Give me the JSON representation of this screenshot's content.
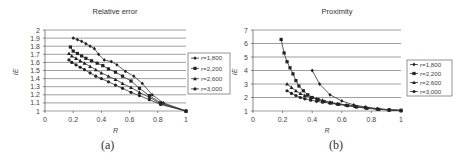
{
  "chart_data": [
    {
      "type": "line",
      "title": "Relative error",
      "xlabel": "R",
      "ylabel": "IE",
      "xlim": [
        0,
        1
      ],
      "ylim": [
        1,
        2
      ],
      "xticks": [
        "0",
        "0.2",
        "0.4",
        "0.6",
        "0.8",
        "1"
      ],
      "yticks": [
        "1",
        "1.1",
        "1.2",
        "1.3",
        "1.4",
        "1.5",
        "1.6",
        "1.7",
        "1.8",
        "1.9",
        "2"
      ],
      "grid": true,
      "legend_position": "right",
      "caption": "(a)",
      "series": [
        {
          "name": "r=1,800",
          "marker": "diamond",
          "x": [
            0.2,
            0.23,
            0.26,
            0.29,
            0.32,
            0.35,
            0.38,
            0.42,
            0.47,
            0.51,
            0.57,
            0.63,
            0.69,
            0.76,
            0.84,
            1.0
          ],
          "y": [
            1.9,
            1.88,
            1.86,
            1.83,
            1.8,
            1.77,
            1.7,
            1.63,
            1.61,
            1.57,
            1.49,
            1.43,
            1.34,
            1.2,
            1.1,
            1.0
          ]
        },
        {
          "name": "r=2,200",
          "marker": "square",
          "x": [
            0.18,
            0.2,
            0.23,
            0.26,
            0.29,
            0.33,
            0.37,
            0.41,
            0.45,
            0.5,
            0.55,
            0.61,
            0.67,
            0.74,
            0.82,
            1.0
          ],
          "y": [
            1.79,
            1.74,
            1.71,
            1.68,
            1.65,
            1.62,
            1.59,
            1.56,
            1.52,
            1.48,
            1.43,
            1.37,
            1.28,
            1.19,
            1.1,
            1.0
          ]
        },
        {
          "name": "r=2,600",
          "marker": "triangle",
          "x": [
            0.17,
            0.19,
            0.22,
            0.25,
            0.28,
            0.32,
            0.36,
            0.4,
            0.45,
            0.5,
            0.55,
            0.61,
            0.67,
            0.74,
            0.82,
            1.0
          ],
          "y": [
            1.71,
            1.68,
            1.65,
            1.62,
            1.59,
            1.55,
            1.51,
            1.47,
            1.43,
            1.39,
            1.34,
            1.29,
            1.23,
            1.17,
            1.09,
            1.0
          ]
        },
        {
          "name": "r=3,000",
          "marker": "circle",
          "x": [
            0.17,
            0.19,
            0.22,
            0.25,
            0.28,
            0.32,
            0.36,
            0.4,
            0.45,
            0.5,
            0.55,
            0.61,
            0.67,
            0.74,
            0.82,
            1.0
          ],
          "y": [
            1.63,
            1.6,
            1.57,
            1.54,
            1.51,
            1.47,
            1.43,
            1.4,
            1.36,
            1.32,
            1.28,
            1.23,
            1.19,
            1.14,
            1.08,
            1.0
          ]
        }
      ]
    },
    {
      "type": "line",
      "title": "Proximity",
      "xlabel": "R",
      "ylabel": "IE",
      "xlim": [
        0,
        1
      ],
      "ylim": [
        1,
        7
      ],
      "xticks": [
        "0",
        "0.2",
        "0.4",
        "0.6",
        "0.8",
        "1"
      ],
      "yticks": [
        "1",
        "2",
        "3",
        "4",
        "5",
        "6",
        "7"
      ],
      "grid": true,
      "legend_position": "right",
      "caption": "(b)",
      "series": [
        {
          "name": "r=1,800",
          "marker": "diamond",
          "x": [
            0.4,
            0.45,
            0.52,
            0.6,
            0.68,
            0.76,
            0.84,
            0.92,
            1.0
          ],
          "y": [
            4.0,
            3.0,
            2.2,
            1.75,
            1.45,
            1.3,
            1.18,
            1.1,
            1.05
          ]
        },
        {
          "name": "r=2,200",
          "marker": "square",
          "x": [
            0.19,
            0.21,
            0.23,
            0.25,
            0.27,
            0.29,
            0.31,
            0.34,
            0.37,
            0.4,
            0.44,
            0.48,
            0.53,
            0.58,
            0.64,
            0.7,
            0.77,
            0.85,
            0.92,
            1.0
          ],
          "y": [
            6.3,
            5.3,
            4.65,
            4.2,
            3.75,
            3.25,
            2.85,
            2.5,
            2.2,
            2.0,
            1.85,
            1.7,
            1.6,
            1.5,
            1.4,
            1.3,
            1.2,
            1.12,
            1.08,
            1.05
          ]
        },
        {
          "name": "r=2,600",
          "marker": "triangle",
          "x": [
            0.23,
            0.26,
            0.29,
            0.32,
            0.35,
            0.39,
            0.43,
            0.47,
            0.52,
            0.57,
            0.63,
            0.69,
            0.76,
            0.84,
            0.92,
            1.0
          ],
          "y": [
            3.0,
            2.75,
            2.5,
            2.3,
            2.15,
            2.0,
            1.9,
            1.8,
            1.65,
            1.55,
            1.45,
            1.35,
            1.25,
            1.15,
            1.08,
            1.03
          ]
        },
        {
          "name": "r=3,000",
          "marker": "circle",
          "x": [
            0.23,
            0.26,
            0.29,
            0.32,
            0.35,
            0.39,
            0.43,
            0.47,
            0.52,
            0.57,
            0.63,
            0.69,
            0.76,
            0.84,
            0.92,
            1.0
          ],
          "y": [
            2.5,
            2.3,
            2.15,
            2.0,
            1.9,
            1.8,
            1.72,
            1.65,
            1.58,
            1.5,
            1.42,
            1.33,
            1.24,
            1.15,
            1.08,
            1.03
          ]
        }
      ]
    }
  ],
  "layout": [
    {
      "plot": {
        "x0": 45,
        "x1": 186,
        "y_top": 30,
        "y_bottom": 111
      },
      "title_x": 115,
      "title_y": 14,
      "legend": {
        "x": 188,
        "y": 53,
        "w": 42,
        "h": 41
      },
      "caption_x": 108,
      "caption_y": 142,
      "ylabel_x": 18,
      "ylabel_y": 72
    },
    {
      "plot": {
        "x0": 253,
        "x1": 401,
        "y_top": 30,
        "y_bottom": 111
      },
      "title_x": 337,
      "title_y": 14,
      "legend": {
        "x": 407,
        "y": 60,
        "w": 45,
        "h": 36
      },
      "caption_x": 335,
      "caption_y": 142,
      "ylabel_x": 237,
      "ylabel_y": 72
    }
  ]
}
